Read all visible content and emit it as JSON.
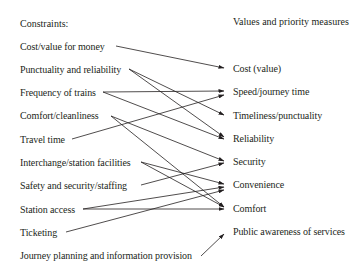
{
  "left_column": {
    "header": "Constraints:",
    "items": [
      "Cost/value for money",
      "Punctuality and reliability",
      "Frequency of trains",
      "Comfort/cleanliness",
      "Travel time",
      "Interchange/station facilities",
      "Safety and security/staffing",
      "Station access",
      "Ticketing",
      "Journey planning and information provision"
    ]
  },
  "right_column": {
    "header": "Values and priority measures",
    "items": [
      "Cost (value)",
      "Speed/journey time",
      "Timeliness/punctuality",
      "Reliability",
      "Security",
      "Convenience",
      "Comfort",
      "Public awareness of services"
    ]
  },
  "connections": [
    {
      "from": "Cost/value for money",
      "to": "Cost (value)"
    },
    {
      "from": "Punctuality and reliability",
      "to": "Timeliness/punctuality"
    },
    {
      "from": "Punctuality and reliability",
      "to": "Reliability"
    },
    {
      "from": "Frequency of trains",
      "to": "Speed/journey time"
    },
    {
      "from": "Frequency of trains",
      "to": "Reliability"
    },
    {
      "from": "Comfort/cleanliness",
      "to": "Security"
    },
    {
      "from": "Comfort/cleanliness",
      "to": "Comfort"
    },
    {
      "from": "Travel time",
      "to": "Speed/journey time"
    },
    {
      "from": "Interchange/station facilities",
      "to": "Convenience"
    },
    {
      "from": "Interchange/station facilities",
      "to": "Comfort"
    },
    {
      "from": "Safety and security/staffing",
      "to": "Security"
    },
    {
      "from": "Station access",
      "to": "Convenience"
    },
    {
      "from": "Station access",
      "to": "Comfort"
    },
    {
      "from": "Ticketing",
      "to": "Convenience"
    },
    {
      "from": "Journey planning and information provision",
      "to": "Public awareness of services"
    }
  ],
  "colors": {
    "text": "#231f20",
    "line": "#231f20",
    "background": "#ffffff"
  }
}
